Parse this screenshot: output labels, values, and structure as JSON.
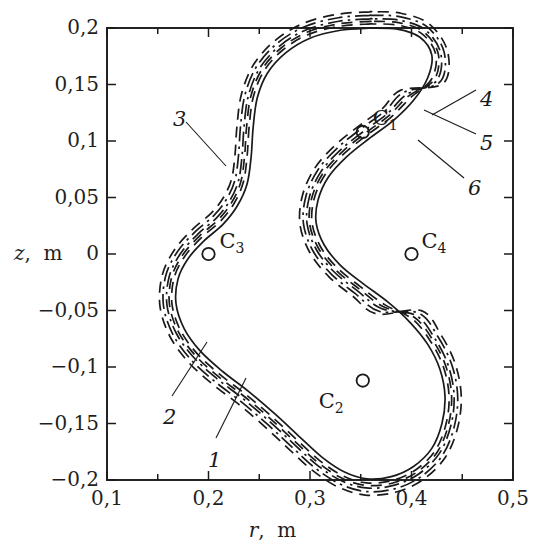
{
  "figure": {
    "kind": "contour-plot",
    "background": "#ffffff",
    "ink_color": "#1a1a1a"
  },
  "axes": {
    "x": {
      "title_var": "r",
      "title_unit": "m",
      "title_full": "r,  m",
      "min": 0.1,
      "max": 0.5,
      "tick_labels": [
        "0,1",
        "0,2",
        "0,3",
        "0,4",
        "0,5"
      ],
      "tick_values": [
        0.1,
        0.2,
        0.3,
        0.4,
        0.5
      ],
      "minor_step": 0.05
    },
    "y": {
      "title_var": "z",
      "title_unit": "m",
      "title_full": "z,  m",
      "min": -0.2,
      "max": 0.2,
      "tick_labels": [
        "0,2",
        "0,15",
        "0,1",
        "0,05",
        "0",
        "−0,05",
        "−0,1",
        "−0,15",
        "−0,2"
      ],
      "tick_values": [
        0.2,
        0.15,
        0.1,
        0.05,
        0.0,
        -0.05,
        -0.1,
        -0.15,
        -0.2
      ],
      "minor_step": 0.05
    },
    "frame": {
      "left": 107,
      "top": 28,
      "right": 513,
      "bottom": 480
    }
  },
  "coils": [
    {
      "name": "C1",
      "label": "C",
      "sub": "1",
      "r": 0.352,
      "z": 0.108,
      "label_dx": 10,
      "label_dy": -26
    },
    {
      "name": "C2",
      "label": "C",
      "sub": "2",
      "r": 0.352,
      "z": -0.112,
      "label_dx": -44,
      "label_dy": 8
    },
    {
      "name": "C3",
      "label": "C",
      "sub": "3",
      "r": 0.2,
      "z": 0.0,
      "label_dx": 11,
      "label_dy": -25
    },
    {
      "name": "C4",
      "label": "C",
      "sub": "4",
      "r": 0.4,
      "z": 0.0,
      "label_dx": 10,
      "label_dy": -25
    }
  ],
  "curve_labels": [
    {
      "id": "1",
      "text": "1",
      "x": 208,
      "y": 448,
      "leader": {
        "x1": 216,
        "y1": 438,
        "x2": 246,
        "y2": 378
      }
    },
    {
      "id": "2",
      "text": "2",
      "x": 163,
      "y": 405,
      "leader": {
        "x1": 172,
        "y1": 396,
        "x2": 207,
        "y2": 342
      }
    },
    {
      "id": "3",
      "text": "3",
      "x": 173,
      "y": 107,
      "leader": {
        "x1": 186,
        "y1": 122,
        "x2": 226,
        "y2": 166
      }
    },
    {
      "id": "4",
      "text": "4",
      "x": 480,
      "y": 87,
      "leader": {
        "x1": 476,
        "y1": 90,
        "x2": 432,
        "y2": 115
      }
    },
    {
      "id": "5",
      "text": "5",
      "x": 480,
      "y": 131,
      "leader": {
        "x1": 476,
        "y1": 134,
        "x2": 424,
        "y2": 110
      }
    },
    {
      "id": "6",
      "text": "6",
      "x": 468,
      "y": 176,
      "leader": {
        "x1": 464,
        "y1": 178,
        "x2": 418,
        "y2": 140
      }
    }
  ],
  "chart_data": {
    "type": "line",
    "title": "",
    "xlabel": "r,  m",
    "ylabel": "z,  m",
    "xlim": [
      0.1,
      0.5
    ],
    "ylim": [
      -0.2,
      0.2
    ],
    "grid": false,
    "legend": "inline-numbered-leaders",
    "markers": {
      "shape": "open-circle",
      "points": [
        {
          "name": "C1",
          "r": 0.352,
          "z": 0.108
        },
        {
          "name": "C2",
          "r": 0.352,
          "z": -0.112
        },
        {
          "name": "C3",
          "r": 0.2,
          "z": 0.0
        },
        {
          "name": "C4",
          "r": 0.4,
          "z": 0.0
        }
      ]
    },
    "series": [
      {
        "name": "1",
        "style": "solid",
        "offset": 0.0,
        "points": [
          [
            0.36,
            0.2
          ],
          [
            0.33,
            0.198
          ],
          [
            0.3,
            0.191
          ],
          [
            0.276,
            0.178
          ],
          [
            0.258,
            0.16
          ],
          [
            0.248,
            0.138
          ],
          [
            0.244,
            0.112
          ],
          [
            0.242,
            0.086
          ],
          [
            0.238,
            0.062
          ],
          [
            0.228,
            0.042
          ],
          [
            0.214,
            0.026
          ],
          [
            0.196,
            0.012
          ],
          [
            0.18,
            -0.004
          ],
          [
            0.17,
            -0.022
          ],
          [
            0.168,
            -0.044
          ],
          [
            0.176,
            -0.066
          ],
          [
            0.192,
            -0.086
          ],
          [
            0.214,
            -0.104
          ],
          [
            0.24,
            -0.122
          ],
          [
            0.266,
            -0.142
          ],
          [
            0.29,
            -0.162
          ],
          [
            0.312,
            -0.18
          ],
          [
            0.334,
            -0.193
          ],
          [
            0.356,
            -0.199
          ],
          [
            0.38,
            -0.197
          ],
          [
            0.402,
            -0.188
          ],
          [
            0.42,
            -0.172
          ],
          [
            0.43,
            -0.15
          ],
          [
            0.433,
            -0.126
          ],
          [
            0.428,
            -0.102
          ],
          [
            0.416,
            -0.08
          ],
          [
            0.398,
            -0.06
          ],
          [
            0.376,
            -0.042
          ],
          [
            0.352,
            -0.026
          ],
          [
            0.33,
            -0.01
          ],
          [
            0.314,
            0.008
          ],
          [
            0.306,
            0.028
          ],
          [
            0.308,
            0.048
          ],
          [
            0.318,
            0.068
          ],
          [
            0.336,
            0.086
          ],
          [
            0.358,
            0.102
          ],
          [
            0.382,
            0.118
          ],
          [
            0.402,
            0.136
          ],
          [
            0.416,
            0.156
          ],
          [
            0.42,
            0.176
          ],
          [
            0.408,
            0.192
          ],
          [
            0.386,
            0.199
          ],
          [
            0.36,
            0.2
          ]
        ]
      },
      {
        "name": "2",
        "style": "dashed",
        "offset": 0.004
      },
      {
        "name": "3",
        "style": "dashed",
        "offset": 0.016
      },
      {
        "name": "4",
        "style": "dash-dot",
        "offset": 0.009
      },
      {
        "name": "5",
        "style": "dashed",
        "offset": 0.0065
      },
      {
        "name": "6",
        "style": "dash-dot",
        "offset": 0.0125
      }
    ]
  }
}
